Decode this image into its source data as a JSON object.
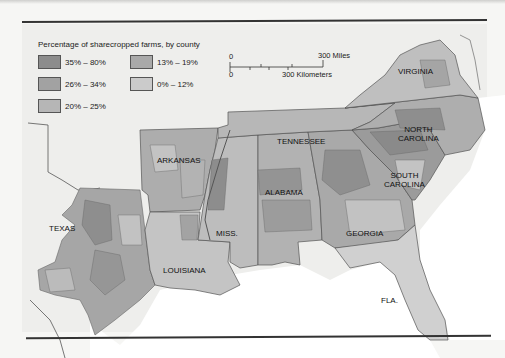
{
  "legend": {
    "title": "Percentage of sharecropped farms, by county",
    "items": [
      {
        "label": "35% – 80%",
        "color": "#8c8c8c"
      },
      {
        "label": "26% – 34%",
        "color": "#a2a2a2"
      },
      {
        "label": "20% – 25%",
        "color": "#b6b6b6"
      },
      {
        "label": "13% – 19%",
        "color": "#a9a9a9"
      },
      {
        "label": "0% – 12%",
        "color": "#cbcbcb"
      }
    ]
  },
  "scale": {
    "zero_top": "0",
    "zero_bottom": "0",
    "miles": "300 Miles",
    "kilometers": "300 Kilometers"
  },
  "states": {
    "virginia": "VIRGINIA",
    "north_carolina": "NORTH\nCAROLINA",
    "tennessee": "TENNESSEE",
    "arkansas": "ARKANSAS",
    "south_carolina": "SOUTH\nCAROLINA",
    "alabama": "ALABAMA",
    "texas": "TEXAS",
    "mississippi": "MISS.",
    "georgia": "GEORGIA",
    "louisiana": "LOUISIANA",
    "florida": "FLA."
  },
  "colors": {
    "background": "#eeeeec",
    "water": "#ffffff",
    "border": "#555555"
  }
}
